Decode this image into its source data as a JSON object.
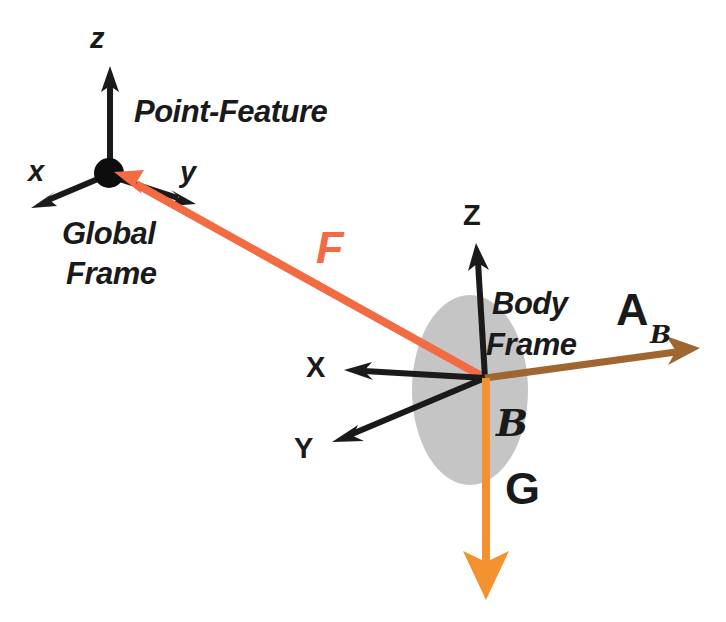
{
  "figure": {
    "background_color": "#ffffff"
  },
  "colors": {
    "axis_black": "#1a1a1a",
    "feature_vector_orange": "#F26B43",
    "gravity_orange": "#F59230",
    "accel_brown": "#A0662F",
    "body_ellipse_gray": "#C5C5C5",
    "text_black": "#1a1a1a"
  },
  "global_frame": {
    "origin_label": "Point-Feature",
    "frame_name_line1": "Global",
    "frame_name_line2": "Frame",
    "axes": [
      {
        "label": "z",
        "direction": "up"
      },
      {
        "label": "x",
        "direction": "down-left"
      },
      {
        "label": "y",
        "direction": "down-right"
      }
    ]
  },
  "body_frame": {
    "frame_name_line1": "Body",
    "frame_name_line2": "Frame",
    "body_symbol": "B",
    "axes": [
      {
        "label": "Z",
        "direction": "up"
      },
      {
        "label": "X",
        "direction": "left"
      },
      {
        "label": "Y",
        "direction": "down-left"
      }
    ]
  },
  "vectors": [
    {
      "label": "F",
      "subscript": "",
      "meaning": "point-feature vector",
      "color": "#F26B43",
      "from": "body-frame-origin",
      "to": "global-frame-origin"
    },
    {
      "label": "A",
      "subscript": "B",
      "meaning": "acceleration in body frame",
      "color": "#A0662F",
      "from": "body-frame-origin",
      "to": "right"
    },
    {
      "label": "G",
      "subscript": "",
      "meaning": "gravity vector",
      "color": "#F59230",
      "from": "body-frame-origin",
      "to": "down"
    }
  ]
}
